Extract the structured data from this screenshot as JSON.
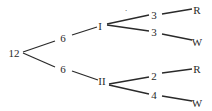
{
  "tree": {
    "root": {
      "label": "12"
    },
    "level1": [
      {
        "label": "6"
      },
      {
        "label": "6"
      }
    ],
    "level2": [
      {
        "label": "I"
      },
      {
        "label": "II"
      }
    ],
    "level3": [
      {
        "label": "3"
      },
      {
        "label": "3"
      },
      {
        "label": "2"
      },
      {
        "label": "4"
      }
    ],
    "leaves": [
      {
        "label": "R"
      },
      {
        "label": "W"
      },
      {
        "label": "R"
      },
      {
        "label": "W"
      }
    ],
    "mark": "·"
  },
  "colors": {
    "line": "#2a2a2a",
    "text": "#2a2a2a",
    "background": "#ffffff"
  }
}
